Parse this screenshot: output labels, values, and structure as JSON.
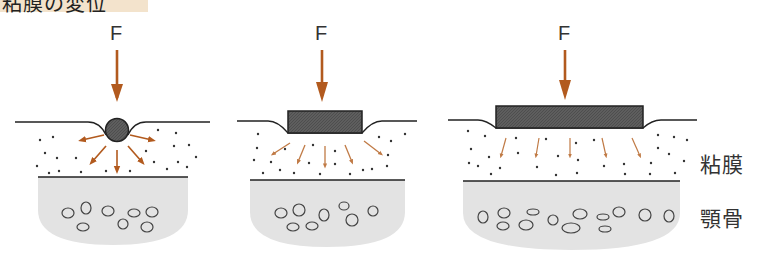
{
  "title": "粘膜の変位",
  "panels": [
    {
      "id": "point-load",
      "force_label": "F",
      "indenter": "ball"
    },
    {
      "id": "small-base",
      "force_label": "F",
      "indenter": "narrow-block"
    },
    {
      "id": "wide-base",
      "force_label": "F",
      "indenter": "wide-block"
    }
  ],
  "labels": {
    "mucosa": "粘膜",
    "jawbone": "顎骨"
  },
  "colors": {
    "arrow": "#b25a1e",
    "indenter": "#5a5a5a",
    "bone_fill": "#e3e3e3",
    "title_bg": "#f3e3cc",
    "line": "#222222"
  }
}
